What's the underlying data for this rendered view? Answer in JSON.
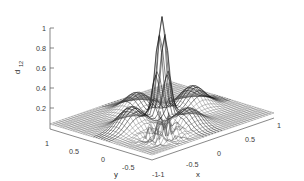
{
  "figure": {
    "kind": "3d-surface-mesh-plot",
    "background_color": "#ffffff",
    "mesh_color": "#404040",
    "axis_color": "#555555",
    "text_color": "#2b2b2b"
  },
  "axes": {
    "z": {
      "label": "d",
      "label_sub": "12",
      "ticks": [
        "1",
        "0.8",
        "0.6",
        "0.4",
        "0.2"
      ],
      "tick_values": [
        1,
        0.8,
        0.6,
        0.4,
        0.2
      ],
      "range": [
        0,
        1
      ]
    },
    "y": {
      "label": "y",
      "ticks": [
        "1",
        "0.5",
        "0",
        "-0.5",
        "-1"
      ],
      "tick_values": [
        1,
        0.5,
        0,
        -0.5,
        -1
      ],
      "range": [
        -1,
        1
      ]
    },
    "x": {
      "label": "x",
      "ticks": [
        "-1",
        "-0.5",
        "0",
        "0.5",
        "1"
      ],
      "tick_values": [
        -1,
        -0.5,
        0,
        0.5,
        1
      ],
      "range": [
        -1,
        1
      ]
    }
  },
  "chart_data": {
    "type": "surface",
    "title": "",
    "xlabel": "x",
    "ylabel": "y",
    "zlabel": "d_12",
    "xlim": [
      -1,
      1
    ],
    "ylim": [
      -1,
      1
    ],
    "zlim": [
      0,
      1
    ],
    "grid": true,
    "legend": "none",
    "colormap": "grayscale",
    "mesh_resolution": 41,
    "features": [
      {
        "name": "central-peak",
        "x": 0.0,
        "y": 0.0,
        "z": 1.0,
        "shape": "sharp-spike"
      },
      {
        "name": "left-dimple",
        "x": -0.5,
        "y": 0.0,
        "z": 0.22,
        "shape": "rounded-bump"
      },
      {
        "name": "right-dimple",
        "x": 0.5,
        "y": 0.0,
        "z": 0.22,
        "shape": "rounded-bump"
      },
      {
        "name": "front-dimple",
        "x": 0.0,
        "y": -0.5,
        "z": 0.18,
        "shape": "rounded-bump"
      },
      {
        "name": "back-dimple",
        "x": 0.0,
        "y": 0.5,
        "z": 0.18,
        "shape": "rounded-bump"
      },
      {
        "name": "noise-artifact",
        "x": -0.45,
        "y": -0.55,
        "z": 0.12,
        "shape": "dark-spiky-noise"
      }
    ],
    "baseline_level": 0.05,
    "x_samples": [
      -1,
      -0.9,
      -0.8,
      -0.7,
      -0.6,
      -0.5,
      -0.4,
      -0.3,
      -0.2,
      -0.1,
      0,
      0.1,
      0.2,
      0.3,
      0.4,
      0.5,
      0.6,
      0.7,
      0.8,
      0.9,
      1
    ],
    "y_samples": [
      -1,
      -0.9,
      -0.8,
      -0.7,
      -0.6,
      -0.5,
      -0.4,
      -0.3,
      -0.2,
      -0.1,
      0,
      0.1,
      0.2,
      0.3,
      0.4,
      0.5,
      0.6,
      0.7,
      0.8,
      0.9,
      1
    ]
  }
}
